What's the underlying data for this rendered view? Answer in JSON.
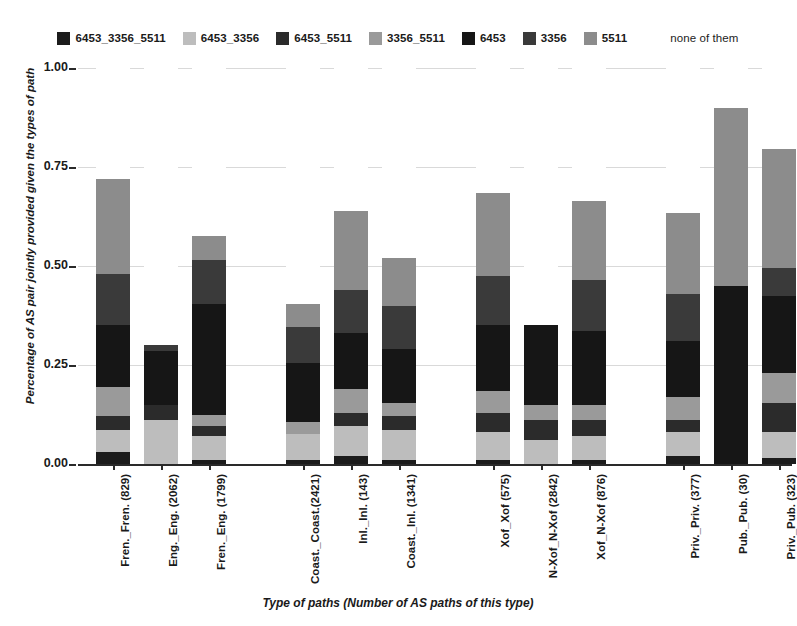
{
  "chart_data": {
    "type": "bar",
    "stacked": true,
    "title": "",
    "xlabel": "Type of paths (Number of AS paths of this type)",
    "ylabel": "Percentage of AS pair jointly provided given the types of path",
    "ylim": [
      0.0,
      1.0
    ],
    "yticks": [
      "0.00",
      "0.25",
      "0.50",
      "0.75",
      "1.00"
    ],
    "ytick_values": [
      0.0,
      0.25,
      0.5,
      0.75,
      1.0
    ],
    "grid": true,
    "legend_position": "top",
    "categories": [
      "Fren._Fren. (829)",
      "Eng._Eng. (2062)",
      "Fren._Eng. (1799)",
      "Coast._Coast.(2421)",
      "Inl._Inl. (143)",
      "Coast._Inl. (1341)",
      "Xof_Xof (575)",
      "N-Xof_N-Xof (2842)",
      "Xof_N-Xof (876)",
      "Priv._Priv. (377)",
      "Pub._Pub. (30)",
      "Priv._Pub. (323)"
    ],
    "group_breaks": [
      3,
      6,
      9
    ],
    "series": [
      {
        "name": "6453_3356_5511",
        "color": "#1c1c1c",
        "values": [
          0.03,
          0.0,
          0.01,
          0.01,
          0.02,
          0.01,
          0.01,
          0.0,
          0.01,
          0.02,
          0.0,
          0.015
        ]
      },
      {
        "name": "6453_3356",
        "color": "#bdbdbd",
        "values": [
          0.055,
          0.11,
          0.06,
          0.065,
          0.075,
          0.075,
          0.07,
          0.06,
          0.06,
          0.06,
          0.0,
          0.065
        ]
      },
      {
        "name": "6453_5511",
        "color": "#2b2b2b",
        "values": [
          0.035,
          0.04,
          0.025,
          0.0,
          0.035,
          0.035,
          0.05,
          0.05,
          0.04,
          0.03,
          0.0,
          0.075
        ]
      },
      {
        "name": "3356_5511",
        "color": "#9a9a9a",
        "values": [
          0.075,
          0.0,
          0.03,
          0.03,
          0.06,
          0.035,
          0.055,
          0.04,
          0.04,
          0.06,
          0.0,
          0.075
        ]
      },
      {
        "name": "6453",
        "color": "#161616",
        "values": [
          0.155,
          0.135,
          0.28,
          0.15,
          0.14,
          0.135,
          0.165,
          0.2,
          0.185,
          0.14,
          0.45,
          0.195
        ]
      },
      {
        "name": "3356",
        "color": "#3a3a3a",
        "values": [
          0.13,
          0.015,
          0.11,
          0.09,
          0.11,
          0.11,
          0.125,
          0.0,
          0.13,
          0.12,
          0.0,
          0.07
        ]
      },
      {
        "name": "5511",
        "color": "#8c8c8c",
        "values": [
          0.24,
          0.0,
          0.06,
          0.06,
          0.2,
          0.12,
          0.21,
          0.0,
          0.2,
          0.205,
          0.45,
          0.3
        ]
      },
      {
        "name": "none of them",
        "color": "#ffffff",
        "values": [
          0.28,
          0.7,
          0.425,
          0.595,
          0.36,
          0.48,
          0.315,
          0.65,
          0.335,
          0.365,
          0.1,
          0.205
        ]
      }
    ],
    "bar_totals": [
      0.72,
      0.3,
      0.575,
      0.405,
      0.64,
      0.52,
      0.685,
      0.35,
      0.665,
      0.635,
      0.9,
      0.795
    ]
  },
  "legend": {
    "items": [
      {
        "label": "6453_3356_5511",
        "color": "#1c1c1c"
      },
      {
        "label": "6453_3356",
        "color": "#bdbdbd"
      },
      {
        "label": "6453_5511",
        "color": "#2b2b2b"
      },
      {
        "label": "3356_5511",
        "color": "#9a9a9a"
      },
      {
        "label": "6453",
        "color": "#161616"
      },
      {
        "label": "3356",
        "color": "#3a3a3a"
      },
      {
        "label": "5511",
        "color": "#8c8c8c"
      },
      {
        "label": "none of them",
        "color": "#ffffff"
      }
    ]
  },
  "axes": {
    "y_label": "Percentage of AS pair jointly provided given the types of path",
    "x_label": "Type of paths (Number of AS paths of this type)"
  }
}
